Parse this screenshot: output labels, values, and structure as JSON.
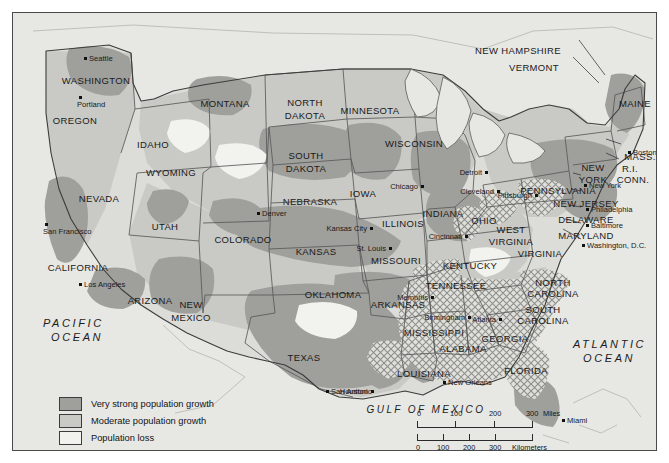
{
  "map": {
    "title": "United States population change and African-American migration",
    "oceans": [
      {
        "name": "pacific-ocean-label",
        "line1": "PACIFIC",
        "line2": "OCEAN"
      },
      {
        "name": "atlantic-ocean-label",
        "line1": "ATLANTIC",
        "line2": "OCEAN"
      }
    ],
    "gulf_label": "GULF OF MEXICO",
    "states": [
      {
        "label": "WASHINGTON",
        "x": 83,
        "y": 63
      },
      {
        "label": "OREGON",
        "x": 62,
        "y": 103
      },
      {
        "label": "IDAHO",
        "x": 140,
        "y": 127
      },
      {
        "label": "MONTANA",
        "x": 212,
        "y": 86
      },
      {
        "label": "WYOMING",
        "x": 158,
        "y": 155
      },
      {
        "label": "NEVADA",
        "x": 86,
        "y": 181
      },
      {
        "label": "UTAH",
        "x": 152,
        "y": 209
      },
      {
        "label": "CALIFORNIA",
        "x": 65,
        "y": 250
      },
      {
        "label": "ARIZONA",
        "x": 137,
        "y": 283
      },
      {
        "label": "NEW",
        "x": 178,
        "y": 287
      },
      {
        "label": "MEXICO",
        "x": 178,
        "y": 300
      },
      {
        "label": "COLORADO",
        "x": 230,
        "y": 222
      },
      {
        "label": "NORTH",
        "x": 292,
        "y": 85
      },
      {
        "label": "DAKOTA",
        "x": 292,
        "y": 98
      },
      {
        "label": "SOUTH",
        "x": 293,
        "y": 138
      },
      {
        "label": "DAKOTA",
        "x": 293,
        "y": 151
      },
      {
        "label": "NEBRASKA",
        "x": 297,
        "y": 184
      },
      {
        "label": "KANSAS",
        "x": 303,
        "y": 234
      },
      {
        "label": "OKLAHOMA",
        "x": 320,
        "y": 277
      },
      {
        "label": "TEXAS",
        "x": 291,
        "y": 340
      },
      {
        "label": "MINNESOTA",
        "x": 357,
        "y": 93
      },
      {
        "label": "IOWA",
        "x": 350,
        "y": 176
      },
      {
        "label": "MISSOURI",
        "x": 383,
        "y": 243
      },
      {
        "label": "ARKANSAS",
        "x": 385,
        "y": 287
      },
      {
        "label": "LOUISIANA",
        "x": 411,
        "y": 356
      },
      {
        "label": "WISCONSIN",
        "x": 401,
        "y": 126
      },
      {
        "label": "ILLINOIS",
        "x": 390,
        "y": 206
      },
      {
        "label": "INDIANA",
        "x": 430,
        "y": 196
      },
      {
        "label": "MISSISSIPPI",
        "x": 421,
        "y": 315
      },
      {
        "label": "ALABAMA",
        "x": 450,
        "y": 331
      },
      {
        "label": "TENNESSEE",
        "x": 443,
        "y": 268
      },
      {
        "label": "KENTUCKY",
        "x": 457,
        "y": 248
      },
      {
        "label": "OHIO",
        "x": 471,
        "y": 203
      },
      {
        "label": "WEST",
        "x": 498,
        "y": 212
      },
      {
        "label": "VIRGINIA",
        "x": 498,
        "y": 224
      },
      {
        "label": "VIRGINIA",
        "x": 527,
        "y": 236
      },
      {
        "label": "GEORGIA",
        "x": 492,
        "y": 321
      },
      {
        "label": "FLORIDA",
        "x": 513,
        "y": 353
      },
      {
        "label": "NORTH",
        "x": 540,
        "y": 265
      },
      {
        "label": "CAROLINA",
        "x": 540,
        "y": 276
      },
      {
        "label": "SOUTH",
        "x": 530,
        "y": 292
      },
      {
        "label": "CAROLINA",
        "x": 530,
        "y": 303
      },
      {
        "label": "NEW",
        "x": 580,
        "y": 150
      },
      {
        "label": "YORK",
        "x": 580,
        "y": 162
      },
      {
        "label": "PENNSYLVANIA",
        "x": 545,
        "y": 173
      },
      {
        "label": "NEW JERSEY",
        "x": 573,
        "y": 186
      },
      {
        "label": "DELAWARE",
        "x": 573,
        "y": 202
      },
      {
        "label": "MARYLAND",
        "x": 573,
        "y": 218
      },
      {
        "label": "MAINE",
        "x": 622,
        "y": 86
      },
      {
        "label": "MASS.",
        "x": 627,
        "y": 139
      },
      {
        "label": "R.I.",
        "x": 617,
        "y": 151
      },
      {
        "label": "CONN.",
        "x": 620,
        "y": 162
      }
    ],
    "leader_states": [
      {
        "label": "NEW HAMPSHIRE",
        "x": 505,
        "y": 33
      },
      {
        "label": "VERMONT",
        "x": 521,
        "y": 50
      }
    ],
    "cities": [
      {
        "label": "Seattle",
        "dx": 71,
        "dy": 44,
        "side": "right"
      },
      {
        "label": "Portland",
        "dx": 66,
        "dy": 83,
        "side": "below"
      },
      {
        "label": "San Francisco",
        "dx": 32,
        "dy": 210,
        "side": "below"
      },
      {
        "label": "Los Angeles",
        "dx": 66,
        "dy": 270,
        "side": "right"
      },
      {
        "label": "Denver",
        "dx": 244,
        "dy": 199,
        "side": "right"
      },
      {
        "label": "Kansas City",
        "dx": 357,
        "dy": 214,
        "side": "left"
      },
      {
        "label": "St. Louis",
        "dx": 376,
        "dy": 234,
        "side": "left"
      },
      {
        "label": "Chicago",
        "dx": 408,
        "dy": 172,
        "side": "left"
      },
      {
        "label": "Detroit",
        "dx": 472,
        "dy": 158,
        "side": "left"
      },
      {
        "label": "Cleveland",
        "dx": 484,
        "dy": 177,
        "side": "left"
      },
      {
        "label": "Cincinnati",
        "dx": 452,
        "dy": 222,
        "side": "left"
      },
      {
        "label": "Pittsburgh",
        "dx": 522,
        "dy": 181,
        "side": "left"
      },
      {
        "label": "Memphis",
        "dx": 418,
        "dy": 283,
        "side": "left"
      },
      {
        "label": "Birmingham",
        "dx": 455,
        "dy": 303,
        "side": "left"
      },
      {
        "label": "Atlanta",
        "dx": 486,
        "dy": 305,
        "side": "left"
      },
      {
        "label": "New Orleans",
        "dx": 430,
        "dy": 368,
        "side": "right"
      },
      {
        "label": "Houston",
        "dx": 358,
        "dy": 377,
        "side": "left"
      },
      {
        "label": "San Antonio",
        "dx": 313,
        "dy": 377,
        "side": "right"
      },
      {
        "label": "Miami",
        "dx": 549,
        "dy": 406,
        "side": "right"
      },
      {
        "label": "Boston",
        "dx": 615,
        "dy": 138,
        "side": "right"
      },
      {
        "label": "New York",
        "dx": 571,
        "dy": 171,
        "side": "right"
      },
      {
        "label": "Philadelphia",
        "dx": 573,
        "dy": 195,
        "side": "right"
      },
      {
        "label": "Baltimore",
        "dx": 573,
        "dy": 211,
        "side": "right"
      },
      {
        "label": "Washington, D.C.",
        "dx": 569,
        "dy": 231,
        "side": "right"
      }
    ]
  },
  "legend": {
    "items": [
      {
        "swatch": "vstrong",
        "label": "Very strong population growth"
      },
      {
        "swatch": "moderate",
        "label": "Moderate population growth"
      },
      {
        "swatch": "loss",
        "label": "Population loss"
      },
      {
        "swatch": "migr",
        "label": "African-American migration"
      }
    ]
  },
  "scale": {
    "miles_ticks": [
      "0",
      "100",
      "200",
      "300"
    ],
    "miles_unit": "Miles",
    "km_ticks": [
      "0",
      "100",
      "200",
      "300"
    ],
    "km_unit": "Kilometers"
  },
  "colors": {
    "very_strong": "#9f9f9c",
    "moderate": "#c9c9c5",
    "loss": "#f1f1ee",
    "ocean": "#e7e7e4",
    "border": "#4a4a4a"
  }
}
